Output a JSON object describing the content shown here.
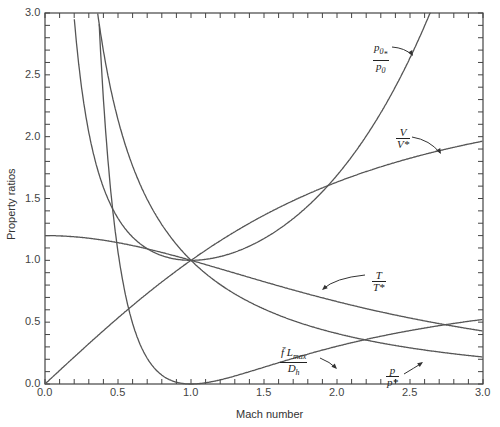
{
  "chart_data": {
    "type": "line",
    "title": "",
    "xlabel": "Mach number",
    "ylabel": "Property ratios",
    "xlim": [
      0.0,
      3.0
    ],
    "ylim": [
      0.0,
      3.0
    ],
    "xticks": [
      "0.0",
      "0.5",
      "1.0",
      "1.5",
      "2.0",
      "2.5",
      "3.0"
    ],
    "yticks": [
      "0.0",
      "0.5",
      "1.0",
      "1.5",
      "2.0",
      "2.5",
      "3.0"
    ],
    "grid": false,
    "legend": "inline curve labels with arrows",
    "x": [
      0.0,
      0.05,
      0.1,
      0.15,
      0.2,
      0.25,
      0.3,
      0.35,
      0.4,
      0.45,
      0.5,
      0.6,
      0.7,
      0.8,
      0.9,
      1.0,
      1.1,
      1.2,
      1.3,
      1.4,
      1.5,
      1.6,
      1.7,
      1.8,
      1.9,
      2.0,
      2.2,
      2.4,
      2.6,
      2.8,
      3.0
    ],
    "series": [
      {
        "name": "T/T*",
        "values": [
          1.2,
          1.1994,
          1.1976,
          1.1946,
          1.1905,
          1.1852,
          1.1788,
          1.1713,
          1.1628,
          1.1533,
          1.1429,
          1.1194,
          1.0929,
          1.0638,
          1.0327,
          1.0,
          0.9662,
          0.9317,
          0.8969,
          0.8621,
          0.8276,
          0.7937,
          0.7605,
          0.7282,
          0.697,
          0.6667,
          0.6098,
          0.558,
          0.5112,
          0.469,
          0.4286
        ]
      },
      {
        "name": "p/p*",
        "values": [
          null,
          21.9,
          10.94,
          7.29,
          5.46,
          4.35,
          3.62,
          3.09,
          2.7,
          2.39,
          2.14,
          1.76,
          1.49,
          1.29,
          1.13,
          1.0,
          0.894,
          0.804,
          0.728,
          0.663,
          0.606,
          0.557,
          0.513,
          0.474,
          0.439,
          0.408,
          0.355,
          0.311,
          0.275,
          0.245,
          0.218
        ]
      },
      {
        "name": "V/V*",
        "values": [
          0.0,
          0.0548,
          0.1094,
          0.1639,
          0.2182,
          0.2722,
          0.3257,
          0.3788,
          0.4313,
          0.4833,
          0.5345,
          0.6348,
          0.7318,
          0.8251,
          0.9146,
          1.0,
          1.0812,
          1.1583,
          1.2311,
          1.2999,
          1.3646,
          1.4254,
          1.4825,
          1.536,
          1.5861,
          1.633,
          1.7179,
          1.7928,
          1.8589,
          1.9175,
          1.964
        ]
      },
      {
        "name": "p0/p0*",
        "values": [
          null,
          11.59,
          5.82,
          3.91,
          2.96,
          2.4,
          2.04,
          1.78,
          1.59,
          1.45,
          1.34,
          1.19,
          1.09,
          1.04,
          1.01,
          1.0,
          1.01,
          1.03,
          1.07,
          1.11,
          1.18,
          1.25,
          1.34,
          1.44,
          1.56,
          1.69,
          2.01,
          2.4,
          2.9,
          3.51,
          4.23
        ]
      },
      {
        "name": "f̄Lmax/Dh",
        "values": [
          null,
          280.02,
          66.92,
          27.93,
          14.53,
          8.48,
          5.3,
          3.45,
          2.31,
          1.57,
          1.07,
          0.491,
          0.208,
          0.0723,
          0.0145,
          0.0,
          0.0099,
          0.0336,
          0.0648,
          0.0997,
          0.1361,
          0.1724,
          0.2078,
          0.2419,
          0.2743,
          0.305,
          0.3609,
          0.4099,
          0.4526,
          0.4898,
          0.5222
        ]
      }
    ],
    "annotations": [
      {
        "label": "p0/p0*",
        "near_x": 2.6,
        "near_y": 2.85
      },
      {
        "label": "V/V*",
        "near_x": 2.45,
        "near_y": 1.8
      },
      {
        "label": "T/T*",
        "near_x": 1.95,
        "near_y": 0.72
      },
      {
        "label": "f̄Lmax/Dh",
        "near_x": 1.5,
        "near_y": 0.15
      },
      {
        "label": "p/p*",
        "near_x": 2.55,
        "near_y": 0.38
      }
    ]
  },
  "labels": {
    "p0": {
      "num": "p0*",
      "num_main": "p",
      "num_sub": "0",
      "num_sub2": "*",
      "den_main": "p",
      "den_sub": "0"
    },
    "v": {
      "num": "V",
      "den": "V*"
    },
    "t": {
      "num": "T",
      "den": "T*"
    },
    "f": {
      "num_main": "f̄ L",
      "num_sub": "max",
      "den_main": "D",
      "den_sub": "h"
    },
    "p": {
      "num": "p",
      "den": "p*"
    }
  },
  "style": {
    "line_color": "#555555",
    "axis_color": "#444444"
  }
}
